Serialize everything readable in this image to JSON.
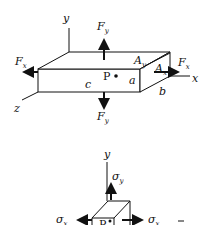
{
  "diagram": {
    "top": {
      "axes": {
        "y": "y",
        "x": "x",
        "z": "z"
      },
      "forces": {
        "fy_top": {
          "base": "F",
          "sub": "y"
        },
        "fy_bottom": {
          "base": "F",
          "sub": "y"
        },
        "fx_left": {
          "base": "F",
          "sub": "x"
        },
        "fx_right": {
          "base": "F",
          "sub": "x"
        }
      },
      "areas": {
        "ay": {
          "base": "A",
          "sub": "y"
        },
        "ax": {
          "base": "A",
          "sub": "x"
        }
      },
      "dimensions": {
        "a": "a",
        "b": "b",
        "c": "c"
      },
      "point": "P"
    },
    "bottom": {
      "axes": {
        "y": "y",
        "x": "x"
      },
      "stresses": {
        "sigma_y": {
          "base": "σ",
          "sub": "y"
        },
        "sigma_x_left": {
          "base": "σ",
          "sub": "x"
        },
        "sigma_x_right": {
          "base": "σ",
          "sub": "x"
        }
      },
      "point": "P"
    }
  }
}
